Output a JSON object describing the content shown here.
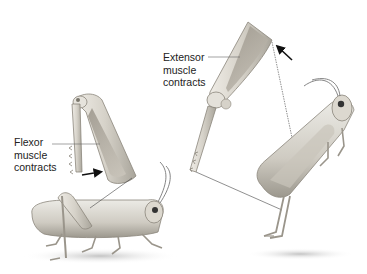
{
  "diagram": {
    "type": "biological-illustration",
    "labels": {
      "flexor": [
        "Flexor",
        "muscle",
        "contracts"
      ],
      "extensor": [
        "Extensor",
        "muscle",
        "contracts"
      ]
    },
    "panels": [
      {
        "name": "flexed-leg",
        "state": "Flexor muscle contracts",
        "arrow": "right"
      },
      {
        "name": "extended-leg",
        "state": "Extensor muscle contracts",
        "arrow": "up-left"
      }
    ],
    "colors": {
      "body": "#d9d6ce",
      "body_dark": "#a8a49a",
      "muscle": "#b9b2a6",
      "line": "#444444",
      "shadow": "#cfcfcf"
    }
  }
}
